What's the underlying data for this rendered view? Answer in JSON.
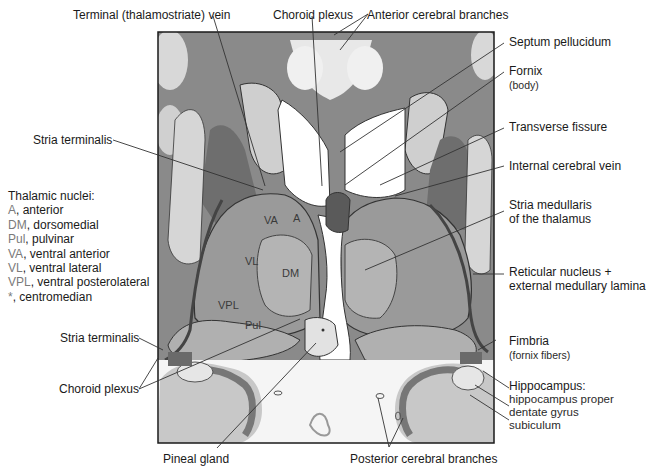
{
  "figure": {
    "type": "coronal brain section diagram",
    "colors": {
      "gray_matter": "#8d8d8d",
      "white_matter": "#c9c9c9",
      "ventricle": "#ffffff",
      "outline": "#333333",
      "frame": "#1a1a1a",
      "legend_abbrev": "#7a7a7a"
    }
  },
  "labels_top": {
    "terminal_vein": "Terminal (thalamostriate) vein",
    "choroid_plexus": "Choroid plexus",
    "anterior_cerebral": "Anterior cerebral branches"
  },
  "labels_right": {
    "septum": "Septum pellucidum",
    "fornix": "Fornix",
    "fornix_sub": "(body)",
    "transverse": "Transverse fissure",
    "internal_vein": "Internal cerebral vein",
    "stria_med_1": "Stria medullaris",
    "stria_med_2": "of the thalamus",
    "reticular_1": "Reticular nucleus +",
    "reticular_2": "external medullary lamina",
    "fimbria": "Fimbria",
    "fimbria_sub": "(fornix fibers)",
    "hippocampus": "Hippocampus:",
    "hippo_proper": "hippocampus proper",
    "dentate": "dentate gyrus",
    "subiculum": "subiculum"
  },
  "labels_left": {
    "stria_terminalis_upper": "Stria terminalis",
    "stria_terminalis_lower": "Stria terminalis",
    "choroid_plexus": "Choroid plexus"
  },
  "labels_bottom": {
    "pineal": "Pineal gland",
    "posterior_cerebral": "Posterior cerebral branches"
  },
  "legend": {
    "title": "Thalamic nuclei:",
    "items": [
      {
        "abbr": "A",
        "text": ", anterior"
      },
      {
        "abbr": "DM",
        "text": ", dorsomedial"
      },
      {
        "abbr": "Pul",
        "text": ", pulvinar"
      },
      {
        "abbr": "VA",
        "text": ", ventral anterior"
      },
      {
        "abbr": "VL",
        "text": ", ventral lateral"
      },
      {
        "abbr": "VPL",
        "text": ", ventral posterolateral"
      },
      {
        "abbr": "*",
        "text": ", centromedian"
      }
    ]
  },
  "nuclei_labels": {
    "va": "VA",
    "a": "A",
    "vl": "VL",
    "dm": "DM",
    "vpl": "VPL",
    "pul": "Pul"
  }
}
